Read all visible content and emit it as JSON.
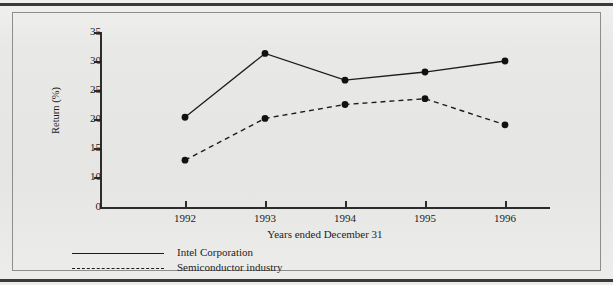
{
  "figure": {
    "background_color": "#e8e8e6",
    "ink_color": "#1d1d1d"
  },
  "chart_data": {
    "type": "line",
    "title": "",
    "xlabel": "Years ended December 31",
    "ylabel": "Return (%)",
    "categories": [
      "1992",
      "1993",
      "1994",
      "1995",
      "1996"
    ],
    "x": [
      1992,
      1993,
      1994,
      1995,
      1996
    ],
    "series": [
      {
        "name": "Intel Corporation",
        "style": "solid",
        "marker": "filled-circle",
        "values": [
          20.3,
          31.3,
          26.7,
          28.1,
          30.0
        ]
      },
      {
        "name": "Semiconductor industry",
        "style": "dashed",
        "marker": "filled-circle",
        "values": [
          12.9,
          20.1,
          22.5,
          23.5,
          19.0
        ]
      }
    ],
    "ylim": [
      8.1,
      35
    ],
    "yticks": [
      10,
      15,
      20,
      25,
      30,
      35
    ],
    "ytick_labels": [
      "10",
      "15",
      "20",
      "25",
      "30",
      "35"
    ],
    "origin_label": "0",
    "axis_break": true,
    "grid": false,
    "legend_position": "below-plot-left"
  },
  "legend": {
    "entries": [
      {
        "label": "Intel Corporation",
        "style": "solid"
      },
      {
        "label": "Semiconductor industry",
        "style": "dashed"
      }
    ]
  }
}
